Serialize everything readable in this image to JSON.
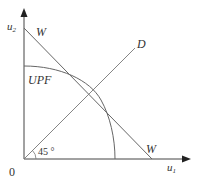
{
  "diagram": {
    "type": "utility-possibility-frontier",
    "axes": {
      "x_label": "u",
      "x_sub": "1",
      "y_label": "u",
      "y_sub": "2",
      "origin_label": "0"
    },
    "curves": {
      "upf_label": "UPF",
      "welfare_label_top": "W",
      "welfare_label_bottom": "W",
      "diagonal_label": "D"
    },
    "angle_label": "45 °",
    "colors": {
      "line": "#555555",
      "text": "#333333",
      "background": "#ffffff"
    }
  }
}
